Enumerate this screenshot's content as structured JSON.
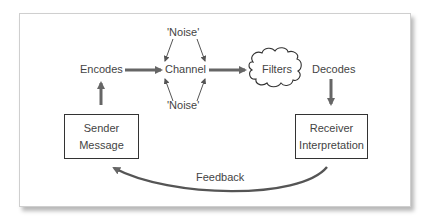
{
  "diagram": {
    "nodes": {
      "encodes": "Encodes",
      "channel": "Channel",
      "noise_top": "'Noise'",
      "noise_bottom": "'Noise'",
      "filters": "Filters",
      "decodes": "Decodes",
      "sender_line1": "Sender",
      "sender_line2": "Message",
      "receiver_line1": "Receiver",
      "receiver_line2": "Interpretation",
      "feedback": "Feedback"
    },
    "colors": {
      "arrow": "#666666",
      "text": "#444444",
      "box_border": "#333333"
    }
  }
}
